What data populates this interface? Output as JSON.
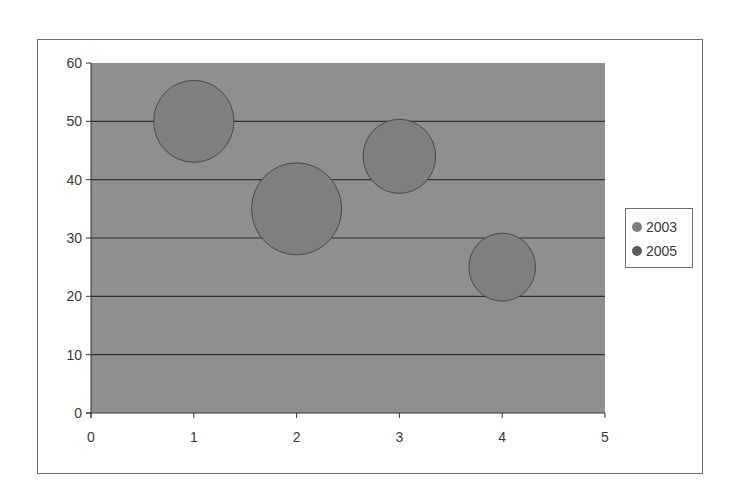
{
  "chart_data": {
    "type": "bubble",
    "title": "",
    "xlabel": "",
    "ylabel": "",
    "xlim": [
      0,
      5
    ],
    "ylim": [
      0,
      60
    ],
    "x_ticks": [
      "0",
      "1",
      "2",
      "3",
      "4",
      "5"
    ],
    "y_ticks": [
      "0",
      "10",
      "20",
      "30",
      "40",
      "50",
      "60"
    ],
    "grid": {
      "horizontal": true,
      "vertical": false
    },
    "legend_position": "right",
    "series": [
      {
        "name": "2003",
        "color": "#7f7f7f",
        "points": [
          {
            "x": 1,
            "y": 50,
            "r_px": 41
          },
          {
            "x": 2,
            "y": 35,
            "r_px": 46
          },
          {
            "x": 3,
            "y": 44,
            "r_px": 37
          },
          {
            "x": 4,
            "y": 25,
            "r_px": 34
          }
        ]
      },
      {
        "name": "2005",
        "color": "#5c5c5c",
        "points": []
      }
    ]
  },
  "legend": {
    "items": [
      {
        "label": "2003",
        "color": "#7f7f7f"
      },
      {
        "label": "2005",
        "color": "#5c5c5c"
      }
    ]
  },
  "colors": {
    "plot_background": "#8f8f8f",
    "gridline": "#333333",
    "bubble_outline": "#4a4a4a",
    "frame": "#6e6e6e"
  }
}
